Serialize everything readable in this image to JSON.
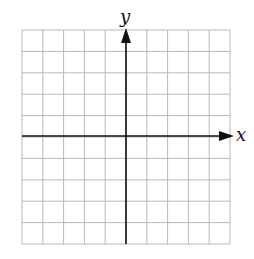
{
  "diagram": {
    "type": "coordinate-grid",
    "grid": {
      "columns": 10,
      "rows": 10,
      "line_color": "#b8b8b8",
      "left": 22,
      "top": 30,
      "right": 230,
      "bottom": 244
    },
    "axes": {
      "color": "#111111",
      "x_label": "x",
      "y_label": "y",
      "x_axis_y": 136,
      "y_axis_x": 126
    }
  }
}
